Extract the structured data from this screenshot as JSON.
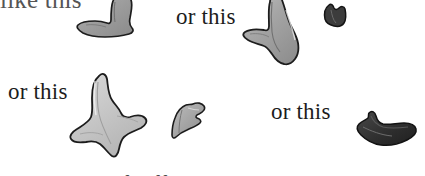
{
  "figure": {
    "background_color": "#ffffff",
    "width": 425,
    "height": 176,
    "kind": "scanned-book-figure-with-ink-blob-shapes"
  },
  "labels": {
    "like_this": "like this",
    "or_this_1": "or this",
    "or_this_2": "or this",
    "or_this_3": "or this",
    "clipped_bottom_line": "all kinds of different shapes, like this"
  },
  "shapes": {
    "outline_color": "#1a1a1a",
    "fill_light": "#c9c9c9",
    "fill_mid": "#9a9a9a",
    "fill_dark": "#3a3a3a",
    "items": [
      {
        "name": "blob-top-left",
        "tone": "mid",
        "x": 76,
        "y": -4,
        "w": 62,
        "h": 46
      },
      {
        "name": "blob-top-center",
        "tone": "mid",
        "x": 242,
        "y": -6,
        "w": 66,
        "h": 80
      },
      {
        "name": "blob-small-dark-top-right",
        "tone": "dark",
        "x": 323,
        "y": 2,
        "w": 24,
        "h": 26
      },
      {
        "name": "blob-large-three-point-left",
        "tone": "light",
        "x": 62,
        "y": 72,
        "w": 96,
        "h": 90
      },
      {
        "name": "blob-small-center",
        "tone": "mid",
        "x": 166,
        "y": 100,
        "w": 42,
        "h": 40
      },
      {
        "name": "blob-dark-bottom-right",
        "tone": "dark",
        "x": 355,
        "y": 109,
        "w": 62,
        "h": 40
      }
    ]
  }
}
